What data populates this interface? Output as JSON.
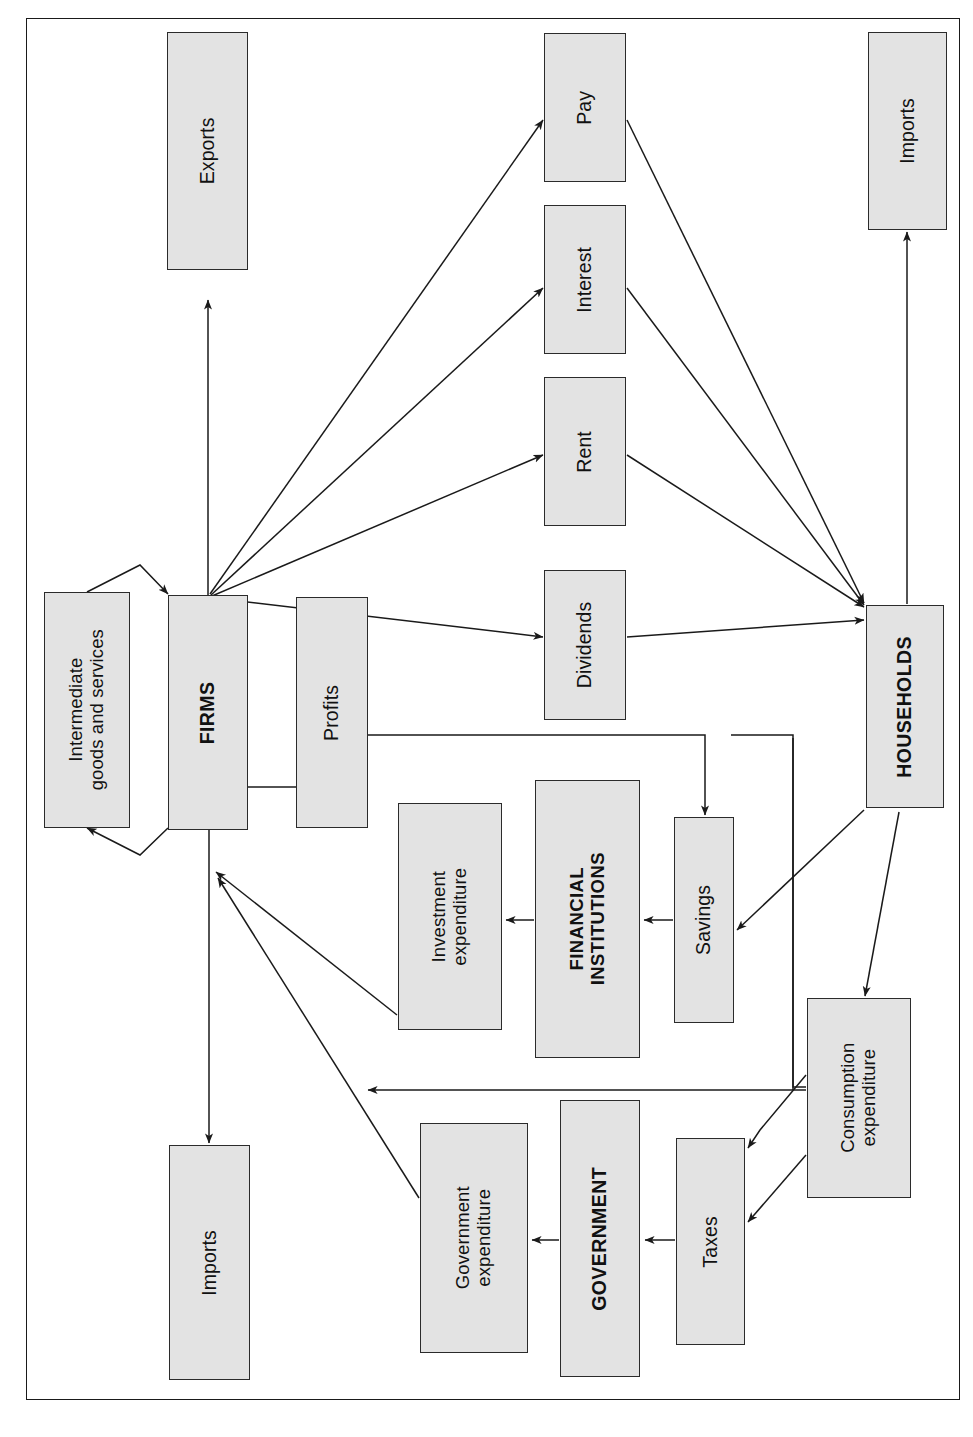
{
  "diagram": {
    "orientation": "rotated-90-ccw",
    "frame": {
      "stroke": "#1a1a1a"
    },
    "style": {
      "node_fill": "#e3e3e3",
      "node_stroke": "#2b2b2b",
      "edge_stroke": "#1a1a1a",
      "text_color": "#111111"
    },
    "nodes": [
      {
        "id": "exports",
        "label": "Exports",
        "kind": "flow",
        "x": 167,
        "y": 32,
        "w": 81,
        "h": 238
      },
      {
        "id": "pay",
        "label": "Pay",
        "kind": "flow",
        "x": 544,
        "y": 33,
        "w": 82,
        "h": 149
      },
      {
        "id": "imports-top",
        "label": "Imports",
        "kind": "flow",
        "x": 868,
        "y": 32,
        "w": 79,
        "h": 198
      },
      {
        "id": "interest",
        "label": "Interest",
        "kind": "flow",
        "x": 544,
        "y": 205,
        "w": 82,
        "h": 149
      },
      {
        "id": "rent",
        "label": "Rent",
        "kind": "flow",
        "x": 544,
        "y": 377,
        "w": 82,
        "h": 149
      },
      {
        "id": "dividends",
        "label": "Dividends",
        "kind": "flow",
        "x": 544,
        "y": 570,
        "w": 82,
        "h": 150
      },
      {
        "id": "intermediate",
        "label": "Intermediate\ngoods and services",
        "kind": "flow",
        "x": 44,
        "y": 592,
        "w": 86,
        "h": 236
      },
      {
        "id": "firms",
        "label": "FIRMS",
        "kind": "sector",
        "x": 168,
        "y": 595,
        "w": 80,
        "h": 235
      },
      {
        "id": "profits",
        "label": "Profits",
        "kind": "flow",
        "x": 296,
        "y": 597,
        "w": 72,
        "h": 231
      },
      {
        "id": "households",
        "label": "HOUSEHOLDS",
        "kind": "sector",
        "x": 866,
        "y": 605,
        "w": 78,
        "h": 203
      },
      {
        "id": "financial",
        "label": "FINANCIAL\nINSTITUTIONS",
        "kind": "sector",
        "x": 535,
        "y": 780,
        "w": 105,
        "h": 278
      },
      {
        "id": "investment",
        "label": "Investment\nexpenditure",
        "kind": "flow",
        "x": 398,
        "y": 803,
        "w": 104,
        "h": 227
      },
      {
        "id": "savings",
        "label": "Savings",
        "kind": "flow",
        "x": 674,
        "y": 817,
        "w": 60,
        "h": 206
      },
      {
        "id": "consumption",
        "label": "Consumption\nexpenditure",
        "kind": "flow",
        "x": 807,
        "y": 998,
        "w": 104,
        "h": 200
      },
      {
        "id": "government",
        "label": "GOVERNMENT",
        "kind": "sector",
        "x": 560,
        "y": 1100,
        "w": 80,
        "h": 277
      },
      {
        "id": "govexp",
        "label": "Government\nexpenditure",
        "kind": "flow",
        "x": 420,
        "y": 1123,
        "w": 108,
        "h": 230
      },
      {
        "id": "taxes",
        "label": "Taxes",
        "kind": "flow",
        "x": 676,
        "y": 1138,
        "w": 69,
        "h": 207
      },
      {
        "id": "imports-bottom",
        "label": "Imports",
        "kind": "flow",
        "x": 169,
        "y": 1145,
        "w": 81,
        "h": 235
      }
    ],
    "edges": [
      {
        "id": "firms-to-exports",
        "from": "firms",
        "to": "exports"
      },
      {
        "id": "firms-to-pay",
        "from": "firms",
        "to": "pay"
      },
      {
        "id": "firms-to-interest",
        "from": "firms",
        "to": "interest"
      },
      {
        "id": "firms-to-rent",
        "from": "firms",
        "to": "rent"
      },
      {
        "id": "firms-to-dividends",
        "from": "firms",
        "to": "dividends"
      },
      {
        "id": "pay-to-households",
        "from": "pay",
        "to": "households"
      },
      {
        "id": "interest-to-households",
        "from": "interest",
        "to": "households"
      },
      {
        "id": "rent-to-households",
        "from": "rent",
        "to": "households"
      },
      {
        "id": "dividends-to-households",
        "from": "dividends",
        "to": "households"
      },
      {
        "id": "households-to-imports",
        "from": "households",
        "to": "imports-top"
      },
      {
        "id": "firms-intermediate-out",
        "from": "firms",
        "to": "intermediate"
      },
      {
        "id": "intermediate-to-firms",
        "from": "intermediate",
        "to": "firms"
      },
      {
        "id": "firms-to-imports",
        "from": "firms",
        "to": "imports-bottom"
      },
      {
        "id": "profits-to-savings",
        "from": "profits",
        "to": "savings"
      },
      {
        "id": "households-to-savings",
        "from": "households",
        "to": "savings"
      },
      {
        "id": "savings-to-financial",
        "from": "savings",
        "to": "financial"
      },
      {
        "id": "financial-to-investment",
        "from": "financial",
        "to": "investment"
      },
      {
        "id": "investment-to-firms",
        "from": "investment",
        "to": "firms"
      },
      {
        "id": "households-to-taxes",
        "from": "households",
        "to": "taxes"
      },
      {
        "id": "consumption-to-taxes",
        "from": "consumption",
        "to": "taxes"
      },
      {
        "id": "taxes-to-government",
        "from": "taxes",
        "to": "government"
      },
      {
        "id": "government-to-govexp",
        "from": "government",
        "to": "govexp"
      },
      {
        "id": "govexp-to-firms",
        "from": "govexp",
        "to": "firms"
      },
      {
        "id": "households-to-consumption",
        "from": "households",
        "to": "consumption"
      },
      {
        "id": "consumption-to-firms",
        "from": "consumption",
        "to": "firms"
      }
    ]
  }
}
